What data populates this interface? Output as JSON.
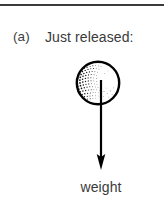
{
  "figure": {
    "part_label": "(a)",
    "caption": "Just released:",
    "force_label": "weight",
    "rule": {
      "present": true,
      "color": "#3b3b3b"
    },
    "ball": {
      "name": "ball",
      "shading": "stippled",
      "shading_side": "left",
      "outline_color": "#000000",
      "fill_color": "#ffffff",
      "center_x": 98,
      "center_y": 37,
      "radius": 22
    },
    "force_arrow": {
      "name": "weight-force-arrow",
      "direction": "down",
      "color": "#000000",
      "start_x": 101,
      "start_y": 34,
      "end_y": 122
    },
    "colors": {
      "ink": "#000000",
      "text": "#3a3a3a",
      "rule": "#3b3b3b",
      "background": "#ffffff"
    }
  }
}
